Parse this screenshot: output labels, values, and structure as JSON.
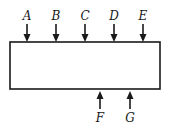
{
  "diagram": {
    "box": {
      "x": 10,
      "y": 42,
      "width": 150,
      "height": 47,
      "stroke": "#1a1a1a"
    },
    "inputs_top": [
      {
        "label": "A",
        "x": 27
      },
      {
        "label": "B",
        "x": 56
      },
      {
        "label": "C",
        "x": 85
      },
      {
        "label": "D",
        "x": 114
      },
      {
        "label": "E",
        "x": 143
      }
    ],
    "inputs_bottom": [
      {
        "label": "F",
        "x": 100
      },
      {
        "label": "G",
        "x": 130
      }
    ]
  }
}
